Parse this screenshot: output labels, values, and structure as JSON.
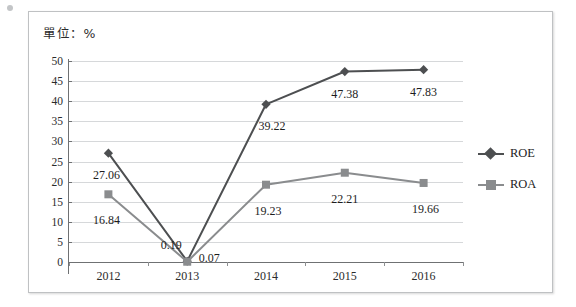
{
  "chart_data": {
    "type": "line",
    "title": "單位：%",
    "xlabel": "",
    "ylabel": "",
    "categories": [
      "2012",
      "2013",
      "2014",
      "2015",
      "2016"
    ],
    "ylim": [
      0,
      50
    ],
    "ytick_step": 5,
    "yticks": [
      "50",
      "45",
      "40",
      "35",
      "30",
      "25",
      "20",
      "15",
      "10",
      "5",
      "0"
    ],
    "grid": true,
    "legend_position": "right",
    "series": [
      {
        "name": "ROE",
        "marker": "diamond",
        "color": "#4d4f51",
        "values": [
          27.06,
          0.19,
          39.22,
          47.38,
          47.83
        ],
        "labels": [
          "27.06",
          "0.19",
          "39.22",
          "47.38",
          "47.83"
        ]
      },
      {
        "name": "ROA",
        "marker": "square",
        "color": "#8a8c8e",
        "values": [
          16.84,
          0.07,
          19.23,
          22.21,
          19.66
        ],
        "labels": [
          "16.84",
          "0.07",
          "19.23",
          "22.21",
          "19.66"
        ]
      }
    ]
  },
  "legend": {
    "items": [
      {
        "label": "ROE"
      },
      {
        "label": "ROA"
      }
    ]
  },
  "colors": {
    "roe": "#4d4f51",
    "roa": "#8a8c8e",
    "grid": "#d6d8da",
    "axis": "#6f7173",
    "frame": "#bfc1c3",
    "text": "#1d1d1d"
  }
}
